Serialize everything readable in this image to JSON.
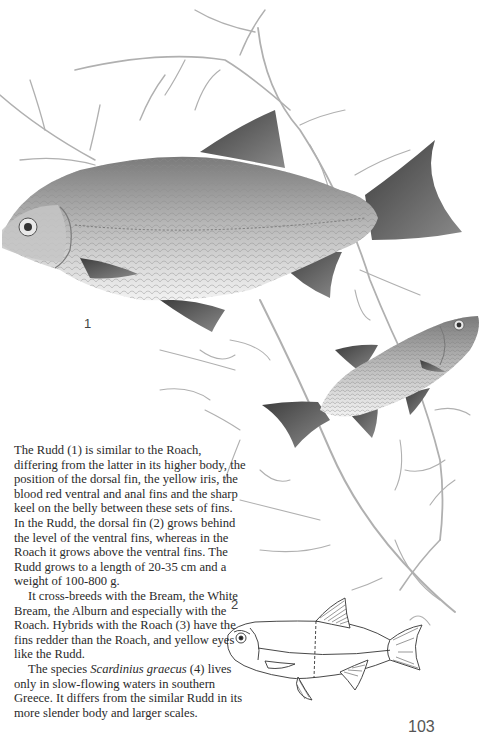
{
  "page": {
    "figure_labels": [
      "1",
      "2"
    ],
    "page_number": "103"
  },
  "text": {
    "paragraph1": "The Rudd (1) is similar to the Roach, differing from the latter in its higher body, the position of the dorsal fin, the yellow iris, the blood red ventral and anal fins and the sharp keel on the belly between these sets of fins. In the Rudd, the dorsal fin (2) grows behind the level of the ventral fins, whereas in the Roach it grows above the ventral fins. The Rudd grows to a length of 20-35 cm and a weight of 100-800 g.",
    "paragraph2": "It cross-breeds with the Bream, the White Bream, the Alburn and especially with the Roach. Hybrids with the Roach (3) have the fins redder than the Roach, and yellow eyes like the Rudd.",
    "paragraph3_prefix": "The species ",
    "paragraph3_species": "Scardinius graecus",
    "paragraph3_suffix": " (4) lives only in slow-flowing waters in southern Greece. It differs from the similar Rudd in its more slender body and larger scales."
  },
  "illustrations": {
    "fish_1": "Rudd, large adult, facing left",
    "fish_small": "Rudd, smaller, swimming upward to the right",
    "fish_2_diagram": "Line drawing showing dorsal fin position relative to ventral fins",
    "plants": "aquatic weed stems"
  },
  "colors": {
    "ink": "#2a2a2a",
    "plant": "#a8a8a8",
    "fish_body": "#b9b9b9",
    "fish_dark": "#555555"
  }
}
